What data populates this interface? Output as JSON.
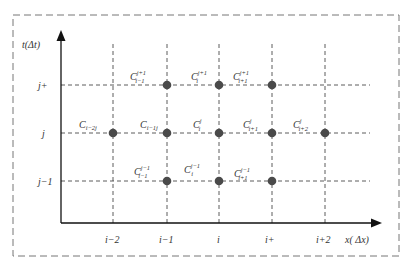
{
  "diagram": {
    "type": "finite-difference-grid",
    "axes": {
      "y_label": "t(Δt)",
      "x_label": "x( Δx)"
    },
    "x_ticks": [
      "i−2",
      "i−1",
      "i",
      "i+",
      "i+2"
    ],
    "y_ticks": [
      "j+",
      "j",
      "j−1"
    ],
    "node_labels": {
      "row_j_plus": [
        {
          "base": "C",
          "sub": "i−1",
          "sup": "j+1"
        },
        {
          "base": "C",
          "sub": "i",
          "sup": "j+1"
        },
        {
          "base": "C",
          "sub": "i+1",
          "sup": "j+1"
        }
      ],
      "row_j": [
        {
          "base": "C",
          "sub": "i−2j",
          "sup": ""
        },
        {
          "base": "C",
          "sub": "i−1j",
          "sup": ""
        },
        {
          "base": "C",
          "sub": "i",
          "sup": "j"
        },
        {
          "base": "C",
          "sub": "i+1",
          "sup": "j"
        },
        {
          "base": "C",
          "sub": "i+2",
          "sup": "j"
        }
      ],
      "row_j_minus": [
        {
          "base": "C",
          "sub": "i−1",
          "sup": "j−1"
        },
        {
          "base": "C",
          "sub": "i",
          "sup": "j−1"
        },
        {
          "base": "C",
          "sub": "i+1",
          "sup": "j−1"
        }
      ]
    },
    "colors": {
      "node": "#4a4a4a",
      "axis": "#111111",
      "grid": "#333333",
      "border": "#777777"
    }
  }
}
